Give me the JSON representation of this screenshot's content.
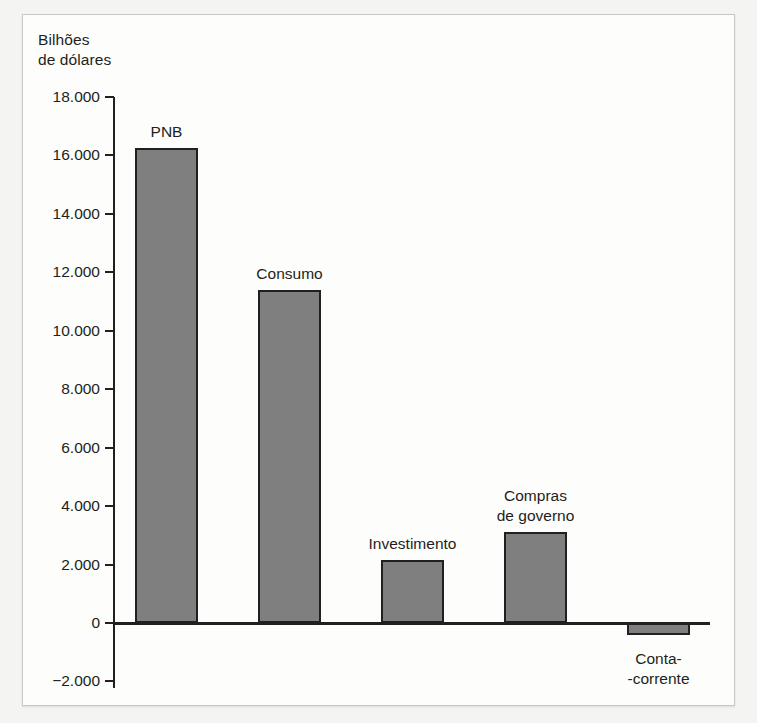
{
  "axis_title": "Bilhões\nde dólares",
  "chart_data": {
    "type": "bar",
    "title": "",
    "subtitle": "",
    "xlabel": "",
    "ylabel": "Bilhões de dólares",
    "ylim": [
      -2000,
      18000
    ],
    "ytick_step": 2000,
    "grid": false,
    "legend": "none",
    "bar_color": "#7f7f7f",
    "bar_outline_color": "#231f20",
    "categories": [
      "PNB",
      "Consumo",
      "Investimento",
      "Compras de governo",
      "Conta-corrente"
    ],
    "values": [
      16250,
      11400,
      2150,
      3100,
      -400
    ],
    "ytick_labels": [
      "18.000",
      "16.000",
      "14.000",
      "12.000",
      "10.000",
      "8.000",
      "6.000",
      "4.000",
      "2.000",
      "0",
      "−2.000"
    ],
    "ytick_values": [
      18000,
      16000,
      14000,
      12000,
      10000,
      8000,
      6000,
      4000,
      2000,
      0,
      -2000
    ],
    "bar_labels": [
      {
        "line1": "PNB",
        "line2": ""
      },
      {
        "line1": "Consumo",
        "line2": ""
      },
      {
        "line1": "Investimento",
        "line2": ""
      },
      {
        "line1": "Compras",
        "line2": "de governo"
      },
      {
        "line1": "Conta-",
        "line2": "-corrente"
      }
    ]
  }
}
